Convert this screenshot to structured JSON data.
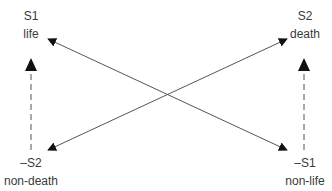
{
  "diagram": {
    "nodes": {
      "top_left": {
        "symbol": "S1",
        "term": "life"
      },
      "top_right": {
        "symbol": "S2",
        "term": "death"
      },
      "bottom_left": {
        "symbol": "–S2",
        "term": "non-death"
      },
      "bottom_right": {
        "symbol": "–S1",
        "term": "non-life"
      }
    },
    "edges": [
      {
        "from": "bottom_right",
        "to": "top_left",
        "style": "solid",
        "arrow": "both"
      },
      {
        "from": "bottom_left",
        "to": "top_right",
        "style": "solid",
        "arrow": "both"
      },
      {
        "from": "bottom_left",
        "to": "top_left",
        "style": "dashed",
        "arrow": "end"
      },
      {
        "from": "bottom_right",
        "to": "top_right",
        "style": "dashed",
        "arrow": "end"
      }
    ],
    "colors": {
      "line": "#555555",
      "arrow": "#111111",
      "text": "#3a3a3a"
    }
  }
}
